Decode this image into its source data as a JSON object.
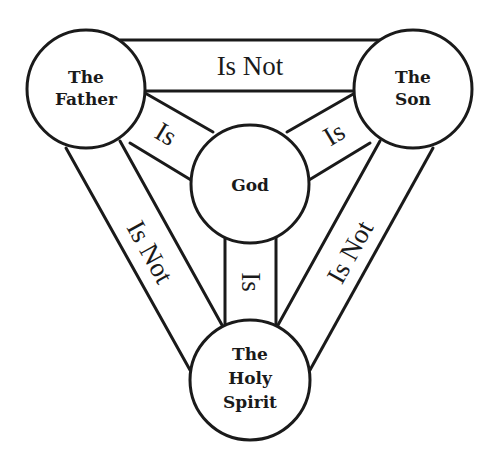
{
  "diagram": {
    "type": "shield-of-the-trinity",
    "colors": {
      "stroke": "#1a1a1a",
      "background": "#ffffff"
    },
    "nodes": {
      "father": {
        "lines": [
          "The",
          "Father"
        ]
      },
      "son": {
        "lines": [
          "The",
          "Son"
        ]
      },
      "god": {
        "lines": [
          "God"
        ]
      },
      "spirit": {
        "lines": [
          "The",
          "Holy",
          "Spirit"
        ]
      }
    },
    "edges": {
      "father_son": {
        "from": "The Father",
        "to": "The Son",
        "label": "Is Not"
      },
      "father_spirit": {
        "from": "The Father",
        "to": "The Holy Spirit",
        "label": "Is Not"
      },
      "son_spirit": {
        "from": "The Son",
        "to": "The Holy Spirit",
        "label": "Is Not"
      },
      "father_god": {
        "from": "The Father",
        "to": "God",
        "label": "Is"
      },
      "son_god": {
        "from": "The Son",
        "to": "God",
        "label": "Is"
      },
      "spirit_god": {
        "from": "The Holy Spirit",
        "to": "God",
        "label": "Is"
      }
    }
  }
}
